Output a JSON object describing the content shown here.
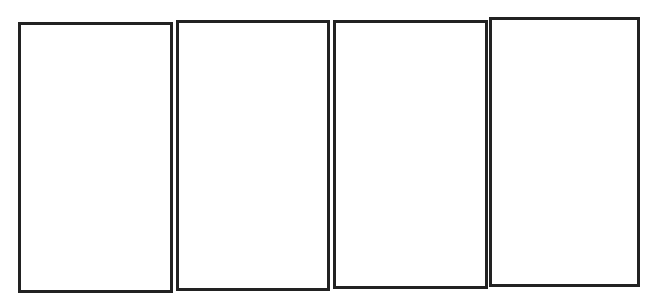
{
  "diagram": {
    "border_color": "#222222",
    "background_color": "#ffffff",
    "panels": [
      {
        "label": "",
        "x": 18,
        "y": 22,
        "width": 155,
        "height": 271
      },
      {
        "label": "",
        "x": 176,
        "y": 20,
        "width": 154,
        "height": 271
      },
      {
        "label": "",
        "x": 333,
        "y": 20,
        "width": 155,
        "height": 269
      },
      {
        "label": "",
        "x": 489,
        "y": 17,
        "width": 151,
        "height": 270
      }
    ]
  }
}
